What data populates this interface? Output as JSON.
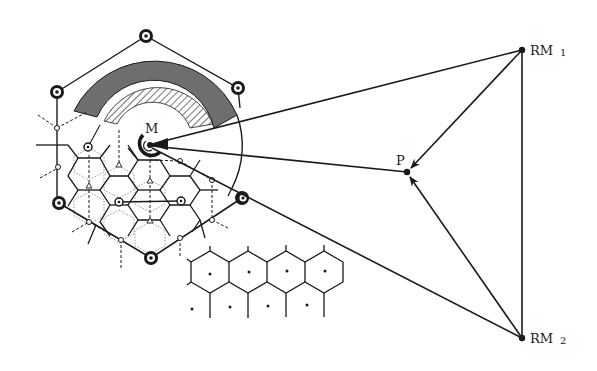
{
  "diagram": {
    "type": "mobile-positioning-network",
    "colors": {
      "ink": "#1a1a1a",
      "band": "#6e6e6e",
      "background": "#ffffff"
    },
    "labels": {
      "mobile": "M",
      "position": "P",
      "ref1": "RM",
      "ref1_sub": "1",
      "ref2": "RM",
      "ref2_sub": "2"
    },
    "nodes": {
      "M": {
        "x": 150,
        "y": 145
      },
      "P": {
        "x": 407,
        "y": 172
      },
      "RM1": {
        "x": 522,
        "y": 50
      },
      "RM2": {
        "x": 522,
        "y": 338
      }
    },
    "base_stations": [
      {
        "x": 146,
        "y": 36
      },
      {
        "x": 57,
        "y": 92
      },
      {
        "x": 238,
        "y": 88
      },
      {
        "x": 59,
        "y": 203
      },
      {
        "x": 151,
        "y": 258
      },
      {
        "x": 242,
        "y": 198
      }
    ],
    "edges": [
      {
        "from": "M",
        "to": "RM1",
        "arrow": false
      },
      {
        "from": "M",
        "to": "P",
        "arrow": false
      },
      {
        "from": "M",
        "to": "RM2",
        "arrow": false
      },
      {
        "from": "RM1",
        "to": "P",
        "arrow": true
      },
      {
        "from": "RM2",
        "to": "P",
        "arrow": true
      },
      {
        "from": "RM1",
        "to": "RM2",
        "arrow": false
      }
    ],
    "annulus": {
      "outer_r": 90,
      "mid_r": 62,
      "inner_r": 40,
      "start_deg": 200,
      "end_deg": 345
    }
  }
}
